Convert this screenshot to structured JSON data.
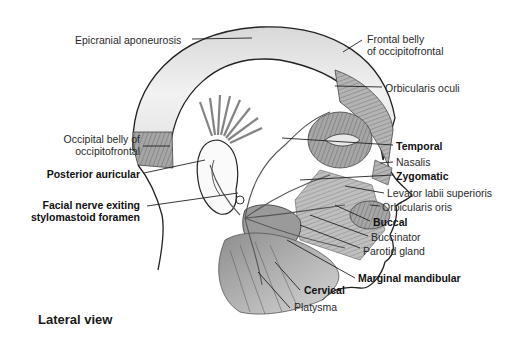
{
  "figure": {
    "caption": "Lateral view",
    "labels": {
      "epicranial_aponeurosis": "Epicranial aponeurosis",
      "frontal_belly_1": "Frontal belly",
      "frontal_belly_2": "of occipitofrontal",
      "orbicularis_oculi": "Orbicularis oculi",
      "occipital_belly_1": "Occipital belly of",
      "occipital_belly_2": "occipitofrontal",
      "temporal": "Temporal",
      "nasalis": "Nasalis",
      "posterior_auricular": "Posterior auricular",
      "zygomatic": "Zygomatic",
      "facial_nerve_1": "Facial nerve exiting",
      "facial_nerve_2": "stylomastoid foramen",
      "levator_labii": "Levator labii superioris",
      "orbicularis_oris": "Orbicularis oris",
      "buccal": "Buccal",
      "buccinator": "Buccinator",
      "parotid_gland": "Parotid gland",
      "marginal_mandibular": "Marginal mandibular",
      "cervical": "Cervical",
      "platysma": "Platysma"
    },
    "nerve_branches_bold": [
      "Temporal",
      "Zygomatic",
      "Buccal",
      "Marginal mandibular",
      "Cervical",
      "Posterior auricular",
      "Facial nerve exiting stylomastoid foramen"
    ],
    "colors": {
      "outline": "#222222",
      "muscle_fill": "#a8a8a8",
      "aponeurosis_fill": "#e6e6e6",
      "nerve": "#555555",
      "text": "#2a2a2a"
    }
  }
}
